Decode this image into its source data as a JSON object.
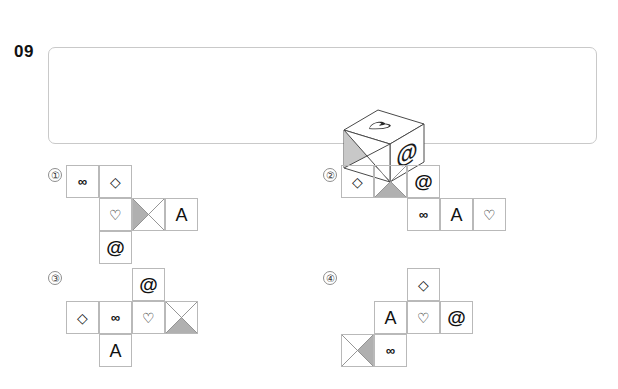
{
  "question": {
    "number": "09",
    "prompt_panel": {
      "border_color": "#c9c9c9"
    }
  },
  "cube": {
    "name": "isometric-cube",
    "faces": {
      "top": {
        "symbol": "heart",
        "glyph": "♡",
        "rotated": true
      },
      "front_left": {
        "symbol": "x-cross",
        "glyph": "",
        "shaded_triangle": "left"
      },
      "right": {
        "symbol": "at",
        "glyph": "@"
      }
    }
  },
  "symbols": {
    "infinity": "∞",
    "diamond": "◇",
    "heart": "♡",
    "at": "@",
    "letter_a": "A",
    "x_cross": "x-cross"
  },
  "shade_color": "#b0b0b0",
  "line_color": "#b9b9b9",
  "options": [
    {
      "label": "①",
      "name": "option-1",
      "cells": [
        {
          "col": 0,
          "row": 0,
          "type": "glyph",
          "value": "∞",
          "kind": "inf"
        },
        {
          "col": 1,
          "row": 0,
          "type": "glyph",
          "value": "◇",
          "kind": "diamond"
        },
        {
          "col": 1,
          "row": 1,
          "type": "glyph",
          "value": "♡",
          "kind": "heart"
        },
        {
          "col": 2,
          "row": 1,
          "type": "cross",
          "value": "x-cross",
          "shaded": "left"
        },
        {
          "col": 3,
          "row": 1,
          "type": "glyph",
          "value": "A",
          "kind": "a"
        },
        {
          "col": 1,
          "row": 2,
          "type": "glyph",
          "value": "@",
          "kind": "at"
        }
      ]
    },
    {
      "label": "②",
      "name": "option-2",
      "cells": [
        {
          "col": 0,
          "row": 0,
          "type": "glyph",
          "value": "◇",
          "kind": "diamond"
        },
        {
          "col": 1,
          "row": 0,
          "type": "cross",
          "value": "x-cross",
          "shaded": "bottom"
        },
        {
          "col": 2,
          "row": 0,
          "type": "glyph",
          "value": "@",
          "kind": "at"
        },
        {
          "col": 2,
          "row": 1,
          "type": "glyph",
          "value": "∞",
          "kind": "inf"
        },
        {
          "col": 3,
          "row": 1,
          "type": "glyph",
          "value": "A",
          "kind": "a"
        },
        {
          "col": 4,
          "row": 1,
          "type": "glyph",
          "value": "♡",
          "kind": "heart"
        }
      ]
    },
    {
      "label": "③",
      "name": "option-3",
      "cells": [
        {
          "col": 2,
          "row": 0,
          "type": "glyph",
          "value": "@",
          "kind": "at"
        },
        {
          "col": 0,
          "row": 1,
          "type": "glyph",
          "value": "◇",
          "kind": "diamond"
        },
        {
          "col": 1,
          "row": 1,
          "type": "glyph",
          "value": "∞",
          "kind": "inf"
        },
        {
          "col": 2,
          "row": 1,
          "type": "glyph",
          "value": "♡",
          "kind": "heart"
        },
        {
          "col": 3,
          "row": 1,
          "type": "cross",
          "value": "x-cross",
          "shaded": "bottom"
        },
        {
          "col": 1,
          "row": 2,
          "type": "glyph",
          "value": "A",
          "kind": "a"
        }
      ]
    },
    {
      "label": "④",
      "name": "option-4",
      "cells": [
        {
          "col": 2,
          "row": 0,
          "type": "glyph",
          "value": "◇",
          "kind": "diamond"
        },
        {
          "col": 1,
          "row": 1,
          "type": "glyph",
          "value": "A",
          "kind": "a"
        },
        {
          "col": 2,
          "row": 1,
          "type": "glyph",
          "value": "♡",
          "kind": "heart"
        },
        {
          "col": 3,
          "row": 1,
          "type": "glyph",
          "value": "@",
          "kind": "at"
        },
        {
          "col": 0,
          "row": 2,
          "type": "cross",
          "value": "x-cross",
          "shaded": "right"
        },
        {
          "col": 1,
          "row": 2,
          "type": "glyph",
          "value": "∞",
          "kind": "inf"
        }
      ]
    }
  ],
  "layout": {
    "option_positions": [
      {
        "x": 48,
        "y": 165,
        "net_x": 18,
        "net_y": 0
      },
      {
        "x": 323,
        "y": 165,
        "net_x": 18,
        "net_y": 0
      },
      {
        "x": 48,
        "y": 268,
        "net_x": 18,
        "net_y": 0
      },
      {
        "x": 323,
        "y": 268,
        "net_x": 18,
        "net_y": 0
      }
    ],
    "cell_size": 33
  }
}
